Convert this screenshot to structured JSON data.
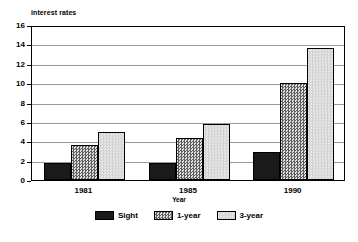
{
  "chart_data": {
    "type": "bar",
    "title": "",
    "xlabel": "Year",
    "ylabel": "interest rates",
    "categories": [
      "1981",
      "1985",
      "1990"
    ],
    "series": [
      {
        "name": "Sight",
        "values": [
          1.8,
          1.8,
          2.9
        ]
      },
      {
        "name": "1-year",
        "values": [
          3.6,
          4.3,
          10.05
        ]
      },
      {
        "name": "3-year",
        "values": [
          5.0,
          5.75,
          13.65
        ]
      }
    ],
    "ylim": [
      0,
      16
    ],
    "ytick_step": 2,
    "yticks": [
      "0",
      "2",
      "4",
      "6",
      "8",
      "10",
      "12",
      "14",
      "16"
    ],
    "grid": "horizontal",
    "legend_position": "bottom-center",
    "colors": {
      "sight": "#1a1a1a",
      "1-year": "#808080",
      "3-year": "#dcdcdc",
      "gridline": "#9a9a9a",
      "axis": "#000000",
      "background": "#ffffff"
    }
  }
}
